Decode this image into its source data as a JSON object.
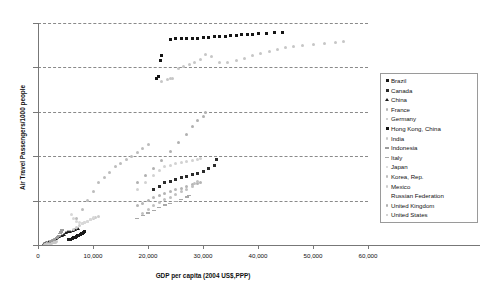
{
  "chart_data": {
    "type": "scatter",
    "title": "",
    "xlabel": "GDP per capita (2004 US$,PPP)",
    "ylabel": "Air Travel Passengers/1000 people",
    "xlim": [
      0,
      60000
    ],
    "ylim": [
      0,
      2500
    ],
    "xticks": [
      0,
      10000,
      20000,
      30000,
      40000,
      50000,
      60000
    ],
    "xtick_labels": [
      "0",
      "10,000",
      "20,000",
      "30,000",
      "40,000",
      "50,000",
      "60,000"
    ],
    "yticks": [
      0,
      500,
      1000,
      1500,
      2000,
      2500
    ],
    "ytick_labels": [
      "0",
      "500",
      "1000",
      "1500",
      "2000",
      "2500"
    ],
    "grid": "horizontal-dashed",
    "legend_position": "right",
    "series": [
      {
        "name": "Brazil",
        "marker": "sq",
        "color": "#1a1a1a",
        "points": [
          [
            5600,
            60
          ],
          [
            5900,
            66
          ],
          [
            6200,
            72
          ],
          [
            6500,
            80
          ],
          [
            6800,
            88
          ],
          [
            7000,
            96
          ],
          [
            7200,
            104
          ],
          [
            7400,
            112
          ],
          [
            7700,
            120
          ],
          [
            7900,
            128
          ],
          [
            8100,
            134
          ],
          [
            8300,
            140
          ],
          [
            8500,
            148
          ]
        ]
      },
      {
        "name": "Canada",
        "marker": "sq",
        "color": "#2b2b2b",
        "points": [
          [
            21000,
            620
          ],
          [
            22000,
            660
          ],
          [
            23000,
            700
          ],
          [
            24000,
            720
          ],
          [
            25000,
            740
          ],
          [
            26000,
            760
          ],
          [
            27000,
            770
          ],
          [
            28000,
            790
          ],
          [
            29000,
            810
          ],
          [
            30000,
            830
          ],
          [
            31000,
            860
          ],
          [
            32000,
            900
          ],
          [
            32500,
            960
          ]
        ]
      },
      {
        "name": "China",
        "marker": "tri",
        "color": "#1a1a1a",
        "points": [
          [
            1000,
            10
          ],
          [
            1200,
            14
          ],
          [
            1400,
            18
          ],
          [
            1700,
            24
          ],
          [
            2000,
            30
          ],
          [
            2300,
            38
          ],
          [
            2600,
            46
          ],
          [
            2900,
            56
          ],
          [
            3200,
            66
          ],
          [
            3500,
            78
          ],
          [
            3900,
            90
          ],
          [
            4300,
            104
          ],
          [
            4700,
            118
          ],
          [
            5100,
            130
          ],
          [
            5500,
            142
          ],
          [
            5900,
            152
          ],
          [
            6300,
            160
          ],
          [
            6700,
            168
          ],
          [
            7200,
            176
          ]
        ]
      },
      {
        "name": "France",
        "marker": "circ",
        "color": "#b4b4b4",
        "points": [
          [
            18000,
            440
          ],
          [
            19000,
            470
          ],
          [
            20000,
            500
          ],
          [
            21000,
            530
          ],
          [
            22000,
            560
          ],
          [
            23000,
            580
          ],
          [
            24000,
            600
          ],
          [
            25000,
            620
          ],
          [
            26000,
            640
          ],
          [
            27000,
            660
          ],
          [
            28000,
            680
          ],
          [
            29000,
            690
          ],
          [
            29500,
            700
          ]
        ]
      },
      {
        "name": "Germany",
        "marker": "circ",
        "color": "#c0c0c0",
        "points": [
          [
            19000,
            360
          ],
          [
            20000,
            400
          ],
          [
            21000,
            440
          ],
          [
            22000,
            480
          ],
          [
            23000,
            510
          ],
          [
            24000,
            540
          ],
          [
            25000,
            570
          ],
          [
            26000,
            600
          ],
          [
            27000,
            630
          ],
          [
            28000,
            660
          ],
          [
            28500,
            690
          ],
          [
            29000,
            720
          ]
        ]
      },
      {
        "name": "Hong Kong, China",
        "marker": "sq",
        "color": "#141414",
        "points": [
          [
            21500,
            1870
          ],
          [
            21900,
            1900
          ],
          [
            22500,
            2130
          ],
          [
            22200,
            2080
          ],
          [
            24000,
            2310
          ],
          [
            25000,
            2320
          ],
          [
            26000,
            2320
          ],
          [
            27000,
            2325
          ],
          [
            28000,
            2330
          ],
          [
            29000,
            2330
          ],
          [
            30000,
            2335
          ],
          [
            31000,
            2340
          ],
          [
            32000,
            2345
          ],
          [
            33000,
            2350
          ],
          [
            34000,
            2350
          ],
          [
            35000,
            2355
          ],
          [
            36000,
            2360
          ],
          [
            37000,
            2365
          ],
          [
            38000,
            2370
          ],
          [
            39000,
            2375
          ],
          [
            40000,
            2380
          ],
          [
            41500,
            2385
          ],
          [
            43000,
            2390
          ],
          [
            44500,
            2395
          ]
        ]
      },
      {
        "name": "India",
        "marker": "circ",
        "color": "#c8c8c8",
        "points": [
          [
            1200,
            8
          ],
          [
            1400,
            10
          ],
          [
            1600,
            12
          ],
          [
            1800,
            14
          ],
          [
            2000,
            16
          ],
          [
            2200,
            18
          ],
          [
            2400,
            20
          ],
          [
            2600,
            23
          ],
          [
            2800,
            26
          ],
          [
            3000,
            29
          ],
          [
            3200,
            32
          ],
          [
            3400,
            36
          ]
        ]
      },
      {
        "name": "Indonesia",
        "marker": "dash",
        "color": "#9c9c9c",
        "points": [
          [
            2000,
            30
          ],
          [
            2300,
            38
          ],
          [
            2600,
            48
          ],
          [
            2900,
            58
          ],
          [
            3200,
            70
          ],
          [
            3400,
            82
          ],
          [
            3600,
            96
          ],
          [
            3800,
            110
          ],
          [
            4000,
            128
          ],
          [
            4200,
            148
          ],
          [
            4400,
            168
          ]
        ]
      },
      {
        "name": "Italy",
        "marker": "dash",
        "color": "#a8a8a8",
        "points": [
          [
            18000,
            300
          ],
          [
            19000,
            330
          ],
          [
            20000,
            360
          ],
          [
            21000,
            390
          ],
          [
            22000,
            420
          ],
          [
            23000,
            450
          ],
          [
            24000,
            470
          ],
          [
            25000,
            490
          ],
          [
            26000,
            510
          ],
          [
            27000,
            540
          ],
          [
            27500,
            560
          ]
        ]
      },
      {
        "name": "Japan",
        "marker": "circ",
        "color": "#d2d2d2",
        "points": [
          [
            18000,
            620
          ],
          [
            19500,
            700
          ],
          [
            21000,
            780
          ],
          [
            22000,
            840
          ],
          [
            23000,
            880
          ],
          [
            24000,
            900
          ],
          [
            25000,
            920
          ],
          [
            26000,
            930
          ],
          [
            27000,
            940
          ],
          [
            28000,
            950
          ],
          [
            29000,
            960
          ],
          [
            29500,
            970
          ]
        ]
      },
      {
        "name": "Korea, Rep.",
        "marker": "circ",
        "color": "#bcbcbc",
        "points": [
          [
            7000,
            300
          ],
          [
            8000,
            400
          ],
          [
            9000,
            500
          ],
          [
            10000,
            600
          ],
          [
            11000,
            700
          ],
          [
            12000,
            760
          ],
          [
            13000,
            820
          ],
          [
            14000,
            880
          ],
          [
            15000,
            920
          ],
          [
            16000,
            960
          ],
          [
            17000,
            1000
          ],
          [
            18000,
            1040
          ],
          [
            19000,
            1090
          ],
          [
            20000,
            1130
          ]
        ]
      },
      {
        "name": "Mexico",
        "marker": "circ",
        "color": "#cccccc",
        "points": [
          [
            6500,
            180
          ],
          [
            7000,
            200
          ],
          [
            7500,
            220
          ],
          [
            8000,
            240
          ],
          [
            8500,
            255
          ],
          [
            9000,
            270
          ],
          [
            9500,
            285
          ],
          [
            10000,
            300
          ],
          [
            10500,
            310
          ],
          [
            11000,
            320
          ]
        ]
      },
      {
        "name": "Russian Federation",
        "marker": "none",
        "color": "#d8d8d8",
        "points": [
          [
            6000,
            340
          ],
          [
            6500,
            300
          ],
          [
            7000,
            270
          ],
          [
            7500,
            250
          ],
          [
            8000,
            240
          ],
          [
            8500,
            250
          ],
          [
            9000,
            265
          ],
          [
            9500,
            285
          ],
          [
            10000,
            310
          ]
        ]
      },
      {
        "name": "United Kingdom",
        "marker": "circ",
        "color": "#b0b0b0",
        "points": [
          [
            18000,
            700
          ],
          [
            19500,
            780
          ],
          [
            21000,
            860
          ],
          [
            22500,
            950
          ],
          [
            24000,
            1050
          ],
          [
            25500,
            1150
          ],
          [
            27000,
            1250
          ],
          [
            28000,
            1330
          ],
          [
            29000,
            1400
          ],
          [
            30000,
            1450
          ],
          [
            30500,
            1490
          ]
        ]
      },
      {
        "name": "United States",
        "marker": "circ",
        "color": "#c6c6c6",
        "points": [
          [
            22500,
            1840
          ],
          [
            23500,
            1860
          ],
          [
            24000,
            1870
          ],
          [
            24500,
            1880
          ],
          [
            25500,
            1990
          ],
          [
            26500,
            2010
          ],
          [
            27500,
            2030
          ],
          [
            28500,
            2060
          ],
          [
            29500,
            2090
          ],
          [
            30500,
            2140
          ],
          [
            31500,
            2120
          ],
          [
            33000,
            2050
          ],
          [
            34500,
            2060
          ],
          [
            36000,
            2080
          ],
          [
            37500,
            2100
          ],
          [
            39000,
            2130
          ],
          [
            40500,
            2160
          ],
          [
            42000,
            2180
          ],
          [
            43500,
            2200
          ],
          [
            45000,
            2220
          ],
          [
            46500,
            2240
          ],
          [
            48000,
            2250
          ],
          [
            50000,
            2260
          ],
          [
            52000,
            2270
          ],
          [
            54000,
            2280
          ],
          [
            55500,
            2290
          ]
        ]
      }
    ]
  },
  "legend": {
    "items": [
      {
        "label": "Brazil",
        "marker": "sq",
        "color": "#1a1a1a"
      },
      {
        "label": "Canada",
        "marker": "sq",
        "color": "#2b2b2b"
      },
      {
        "label": "China",
        "marker": "tri",
        "color": "#1a1a1a"
      },
      {
        "label": "France",
        "marker": "circ",
        "color": "#b4b4b4"
      },
      {
        "label": "Germany",
        "marker": "circ",
        "color": "#c0c0c0"
      },
      {
        "label": "Hong Kong, China",
        "marker": "sq",
        "color": "#141414"
      },
      {
        "label": "India",
        "marker": "circ",
        "color": "#c8c8c8"
      },
      {
        "label": "Indonesia",
        "marker": "dash",
        "color": "#9c9c9c"
      },
      {
        "label": "Italy",
        "marker": "dash",
        "color": "#a8a8a8"
      },
      {
        "label": "Japan",
        "marker": "circ",
        "color": "#d2d2d2"
      },
      {
        "label": "Korea, Rep.",
        "marker": "circ",
        "color": "#bcbcbc"
      },
      {
        "label": "Mexico",
        "marker": "circ",
        "color": "#cccccc"
      },
      {
        "label": "Russian Federation",
        "marker": "none",
        "color": "#d8d8d8"
      },
      {
        "label": "United Kingdom",
        "marker": "circ",
        "color": "#b0b0b0"
      },
      {
        "label": "United States",
        "marker": "circ",
        "color": "#c6c6c6"
      }
    ]
  }
}
